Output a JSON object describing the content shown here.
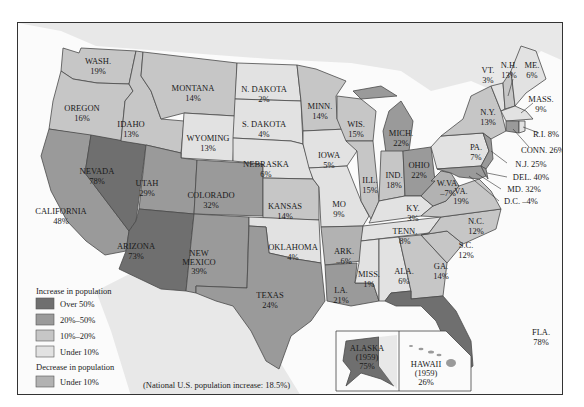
{
  "colors": {
    "over_50": "#6f6f6f",
    "p20_50": "#9a9a9a",
    "p10_20": "#c6c6c6",
    "under_10": "#e2e2e2",
    "decrease": "#b2b2b2",
    "water": "#fbfbfb",
    "foreign": "#e8e8e8"
  },
  "legend": {
    "increase_title": "Increase in population",
    "items": [
      {
        "label": "Over 50%",
        "color": "#6f6f6f"
      },
      {
        "label": "20%–50%",
        "color": "#9a9a9a"
      },
      {
        "label": "10%–20%",
        "color": "#c6c6c6"
      },
      {
        "label": "Under 10%",
        "color": "#e2e2e2"
      }
    ],
    "decrease_title": "Decrease in population",
    "decrease_item": {
      "label": "Under 10%",
      "color": "#b2b2b2"
    }
  },
  "note": "(National U.S. population increase: 18.5%)",
  "states": {
    "wash": {
      "name": "WASH.",
      "value": "19%"
    },
    "oregon": {
      "name": "OREGON",
      "value": "16%"
    },
    "california": {
      "name": "CALIFORNIA",
      "value": "48%"
    },
    "idaho": {
      "name": "IDAHO",
      "value": "13%"
    },
    "nevada": {
      "name": "NEVADA",
      "value": "78%"
    },
    "montana": {
      "name": "MONTANA",
      "value": "14%"
    },
    "wyoming": {
      "name": "WYOMING",
      "value": "13%"
    },
    "utah": {
      "name": "UTAH",
      "value": "29%"
    },
    "arizona": {
      "name": "ARIZONA",
      "value": "73%"
    },
    "colorado": {
      "name": "COLORADO",
      "value": "32%"
    },
    "new_mexico": {
      "name1": "NEW",
      "name2": "MEXICO",
      "value": "39%"
    },
    "n_dakota": {
      "name": "N. DAKOTA",
      "value": "2%"
    },
    "s_dakota": {
      "name": "S. DAKOTA",
      "value": "4%"
    },
    "nebraska": {
      "name": "NEBRASKA",
      "value": "6%"
    },
    "kansas": {
      "name": "KANSAS",
      "value": "14%"
    },
    "oklahoma": {
      "name": "OKLAHOMA",
      "value": "4%"
    },
    "texas": {
      "name": "TEXAS",
      "value": "24%"
    },
    "minn": {
      "name": "MINN.",
      "value": "14%"
    },
    "iowa": {
      "name": "IOWA",
      "value": "5%"
    },
    "mo": {
      "name": "MO",
      "value": "9%"
    },
    "ark": {
      "name": "ARK.",
      "value": "–6%"
    },
    "la": {
      "name": "LA.",
      "value": "21%"
    },
    "wis": {
      "name": "WIS.",
      "value": "15%"
    },
    "ill": {
      "name": "ILL.",
      "value": "15%"
    },
    "mich": {
      "name": "MICH.",
      "value": "22%"
    },
    "ind": {
      "name": "IND.",
      "value": "18%"
    },
    "ohio": {
      "name": "OHIO",
      "value": "22%"
    },
    "ky": {
      "name": "KY.",
      "value": "3%"
    },
    "tenn": {
      "name": "TENN.",
      "value": "8%"
    },
    "miss": {
      "name": "MISS.",
      "value": "1%"
    },
    "ala": {
      "name": "ALA.",
      "value": "6%"
    },
    "ga": {
      "name": "GA.",
      "value": "14%"
    },
    "fla": {
      "name": "FLA.",
      "value": "78%"
    },
    "sc": {
      "name": "S.C.",
      "value": "12%"
    },
    "nc": {
      "name": "N.C.",
      "value": "12%"
    },
    "va": {
      "name": "VA.",
      "value": "19%"
    },
    "wva": {
      "name": "W.VA.",
      "value": "–7%"
    },
    "pa": {
      "name": "PA.",
      "value": "7%"
    },
    "ny": {
      "name": "N.Y.",
      "value": "13%"
    },
    "vt": {
      "name": "VT.",
      "value": "3%"
    },
    "nh": {
      "name": "N.H.",
      "value": "13%"
    },
    "me": {
      "name": "ME.",
      "value": "6%"
    },
    "mass": {
      "name": "MASS.",
      "value": "9%"
    },
    "ri": {
      "label": "R.I. 8%"
    },
    "conn": {
      "label": "CONN. 26%"
    },
    "nj": {
      "label": "N.J. 25%"
    },
    "del": {
      "label": "DEL. 40%"
    },
    "md": {
      "label": "MD. 32%"
    },
    "dc": {
      "label": "D.C. –4%"
    },
    "alaska": {
      "name": "ALASKA",
      "year": "(1959)",
      "value": "75%"
    },
    "hawaii": {
      "name": "HAWAII",
      "year": "(1959)",
      "value": "26%"
    }
  }
}
